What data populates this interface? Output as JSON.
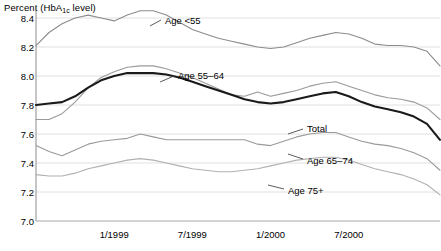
{
  "chart_data": {
    "type": "line",
    "title": "",
    "ylabel": "Percent (HbA1c level)",
    "ylabel_parts": {
      "pre": "Percent (HbA",
      "sub": "1c",
      "post": " level)"
    },
    "xlabel": "",
    "ylim": [
      7.0,
      8.4
    ],
    "y_ticks": [
      7.0,
      7.2,
      7.4,
      7.6,
      7.8,
      8.0,
      8.2,
      8.4
    ],
    "y_tick_labels": [
      "7.0",
      "7.2",
      "7.4",
      "7.6",
      "7.8",
      "8.0",
      "8.2",
      "8.4"
    ],
    "grid": true,
    "legend_position": "inline-annotations",
    "x_tick_labels": [
      "1/1999",
      "7/1999",
      "1/2000",
      "7/2000"
    ],
    "x_tick_positions": [
      6,
      12,
      18,
      24
    ],
    "x_range": [
      0,
      31
    ],
    "series": [
      {
        "name": "Age <55",
        "label": "Age <55",
        "color": "#8c8c8c",
        "width": 1.1,
        "x": [
          0,
          1,
          2,
          3,
          4,
          5,
          6,
          7,
          8,
          9,
          10,
          11,
          12,
          13,
          14,
          15,
          16,
          17,
          18,
          19,
          20,
          21,
          22,
          23,
          24,
          25,
          26,
          27,
          28,
          29,
          30,
          31
        ],
        "values": [
          8.21,
          8.3,
          8.36,
          8.4,
          8.42,
          8.4,
          8.38,
          8.42,
          8.45,
          8.45,
          8.42,
          8.37,
          8.32,
          8.29,
          8.26,
          8.24,
          8.22,
          8.2,
          8.19,
          8.2,
          8.23,
          8.26,
          8.28,
          8.3,
          8.29,
          8.26,
          8.22,
          8.21,
          8.21,
          8.2,
          8.17,
          8.07
        ]
      },
      {
        "name": "Age 55-64",
        "label": "Age 55–64",
        "color": "#9a9a9a",
        "width": 1.1,
        "x": [
          0,
          1,
          2,
          3,
          4,
          5,
          6,
          7,
          8,
          9,
          10,
          11,
          12,
          13,
          14,
          15,
          16,
          17,
          18,
          19,
          20,
          21,
          22,
          23,
          24,
          25,
          26,
          27,
          28,
          29,
          30,
          31
        ],
        "values": [
          7.7,
          7.7,
          7.74,
          7.82,
          7.92,
          7.99,
          8.03,
          8.06,
          8.07,
          8.07,
          8.05,
          8.02,
          7.99,
          7.95,
          7.91,
          7.87,
          7.86,
          7.89,
          7.86,
          7.88,
          7.9,
          7.93,
          7.95,
          7.96,
          7.93,
          7.9,
          7.87,
          7.85,
          7.84,
          7.82,
          7.78,
          7.7
        ]
      },
      {
        "name": "Total",
        "label": "Total",
        "color": "#1a1a1a",
        "width": 2.1,
        "x": [
          0,
          1,
          2,
          3,
          4,
          5,
          6,
          7,
          8,
          9,
          10,
          11,
          12,
          13,
          14,
          15,
          16,
          17,
          18,
          19,
          20,
          21,
          22,
          23,
          24,
          25,
          26,
          27,
          28,
          29,
          30,
          31
        ],
        "values": [
          7.8,
          7.81,
          7.82,
          7.86,
          7.92,
          7.97,
          8.0,
          8.02,
          8.02,
          8.02,
          8.01,
          7.99,
          7.96,
          7.93,
          7.9,
          7.87,
          7.84,
          7.82,
          7.81,
          7.82,
          7.84,
          7.86,
          7.88,
          7.89,
          7.86,
          7.82,
          7.79,
          7.77,
          7.75,
          7.72,
          7.67,
          7.56
        ]
      },
      {
        "name": "Age 65-74",
        "label": "Age 65–74",
        "color": "#9a9a9a",
        "width": 1.1,
        "x": [
          0,
          1,
          2,
          3,
          4,
          5,
          6,
          7,
          8,
          9,
          10,
          11,
          12,
          13,
          14,
          15,
          16,
          17,
          18,
          19,
          20,
          21,
          22,
          23,
          24,
          25,
          26,
          27,
          28,
          29,
          30,
          31
        ],
        "values": [
          7.52,
          7.48,
          7.45,
          7.49,
          7.53,
          7.55,
          7.56,
          7.57,
          7.6,
          7.58,
          7.56,
          7.56,
          7.56,
          7.56,
          7.56,
          7.56,
          7.56,
          7.53,
          7.52,
          7.55,
          7.58,
          7.6,
          7.61,
          7.61,
          7.58,
          7.55,
          7.53,
          7.52,
          7.5,
          7.47,
          7.43,
          7.35
        ]
      },
      {
        "name": "Age 75+",
        "label": "Age 75+",
        "color": "#b0b0b0",
        "width": 1.1,
        "x": [
          0,
          1,
          2,
          3,
          4,
          5,
          6,
          7,
          8,
          9,
          10,
          11,
          12,
          13,
          14,
          15,
          16,
          17,
          18,
          19,
          20,
          21,
          22,
          23,
          24,
          25,
          26,
          27,
          28,
          29,
          30,
          31
        ],
        "values": [
          7.32,
          7.31,
          7.31,
          7.33,
          7.36,
          7.38,
          7.4,
          7.42,
          7.43,
          7.42,
          7.4,
          7.38,
          7.36,
          7.35,
          7.34,
          7.34,
          7.35,
          7.36,
          7.38,
          7.4,
          7.42,
          7.43,
          7.44,
          7.44,
          7.42,
          7.39,
          7.36,
          7.34,
          7.32,
          7.29,
          7.25,
          7.18
        ]
      }
    ],
    "annotations": [
      {
        "text": "Age <55",
        "text_x": 165,
        "text_y": 20,
        "leader": [
          150,
          26,
          161,
          20
        ]
      },
      {
        "text": "Age 55–64",
        "text_x": 178,
        "text_y": 75,
        "leader": [
          160,
          82,
          174,
          76
        ]
      },
      {
        "text": "Total",
        "text_x": 307,
        "text_y": 128,
        "leader": [
          288,
          134,
          303,
          129
        ]
      },
      {
        "text": "Age 65–74",
        "text_x": 307,
        "text_y": 160,
        "leader": [
          288,
          154,
          303,
          159
        ]
      },
      {
        "text": "Age 75+",
        "text_x": 288,
        "text_y": 190,
        "leader": [
          268,
          185,
          284,
          189
        ]
      }
    ]
  }
}
